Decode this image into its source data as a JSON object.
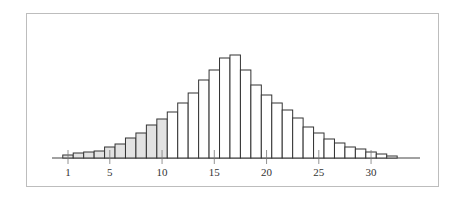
{
  "chart_data": {
    "type": "bar",
    "title": "",
    "xlabel": "",
    "ylabel": "",
    "grid": false,
    "legend": null,
    "categories": [
      1,
      2,
      3,
      4,
      5,
      6,
      7,
      8,
      9,
      10,
      11,
      12,
      13,
      14,
      15,
      16,
      17,
      18,
      19,
      20,
      21,
      22,
      23,
      24,
      25,
      26,
      27,
      28,
      29,
      30,
      31,
      32
    ],
    "values": [
      3,
      5,
      6,
      7,
      11,
      14,
      20,
      25,
      33,
      39,
      46,
      55,
      65,
      78,
      88,
      100,
      103,
      88,
      73,
      63,
      55,
      48,
      40,
      31,
      25,
      19,
      15,
      11,
      9,
      6,
      4,
      2
    ],
    "highlighted_range": [
      1,
      10
    ],
    "highlight_color": "#e2e2e2",
    "bar_fill": "#ffffff",
    "bar_stroke": "#333333",
    "x_ticks": [
      1,
      5,
      10,
      15,
      20,
      25,
      30
    ],
    "x_tick_labels": [
      "1",
      "5",
      "10",
      "15",
      "20",
      "25",
      "30"
    ],
    "ylim": [
      0,
      105
    ]
  }
}
